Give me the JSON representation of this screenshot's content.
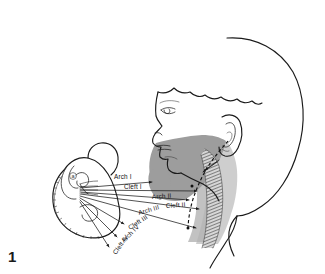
{
  "figure": {
    "number": "1",
    "embryo_marker": "a",
    "colors": {
      "ink": "#1a1a1a",
      "cheek_shade": "#9a9a9a",
      "neck_shade": "#bdbdbd",
      "muscle_shade": "#6e6e6e",
      "background": "#ffffff"
    }
  },
  "labels": [
    {
      "id": "arch-1",
      "text": "Arch I",
      "x": 114,
      "y": 179,
      "rotate": 0
    },
    {
      "id": "cleft-1",
      "text": "Cleft I",
      "x": 124,
      "y": 189,
      "rotate": 0
    },
    {
      "id": "arch-2",
      "text": "Arch II",
      "x": 152,
      "y": 199,
      "rotate": -4
    },
    {
      "id": "cleft-2",
      "text": "Cleft II",
      "x": 166,
      "y": 208,
      "rotate": -4
    },
    {
      "id": "arch-3",
      "text": "Arch III",
      "x": 139,
      "y": 215,
      "rotate": -16
    },
    {
      "id": "cleft-3",
      "text": "Cleft III",
      "x": 130,
      "y": 230,
      "rotate": -33
    },
    {
      "id": "arch-4",
      "text": "Arch IV",
      "x": 124,
      "y": 243,
      "rotate": -45
    },
    {
      "id": "cleft-4",
      "text": "Cleft IV",
      "x": 116,
      "y": 255,
      "rotate": -55
    }
  ],
  "leaders": [
    {
      "id": "leader-arch-1",
      "from": [
        80,
        188
      ],
      "to": [
        152,
        182
      ],
      "head": "arrow"
    },
    {
      "id": "leader-cleft-1",
      "from": [
        80,
        190
      ],
      "to": [
        197,
        191
      ],
      "head": "arrow"
    },
    {
      "id": "leader-arch-2",
      "from": [
        80,
        192
      ],
      "to": [
        189,
        200
      ],
      "head": "arrow"
    },
    {
      "id": "leader-cleft-2",
      "from": [
        80,
        194
      ],
      "to": [
        199,
        209
      ],
      "head": "arrow"
    },
    {
      "id": "leader-arch-3",
      "from": [
        80,
        196
      ],
      "to": [
        196,
        228
      ],
      "head": "arrow"
    },
    {
      "id": "leader-cleft-3",
      "from": [
        80,
        198
      ],
      "to": [
        124,
        224
      ],
      "head": "tri"
    },
    {
      "id": "leader-arch-4",
      "from": [
        80,
        200
      ],
      "to": [
        117,
        237
      ],
      "head": "tri"
    },
    {
      "id": "leader-cleft-4",
      "from": [
        80,
        202
      ],
      "to": [
        109,
        247
      ],
      "head": "tri"
    },
    {
      "id": "leader-neck-pointer",
      "from": [
        217,
        162
      ],
      "to": [
        203,
        172
      ],
      "head": "arrow"
    }
  ]
}
